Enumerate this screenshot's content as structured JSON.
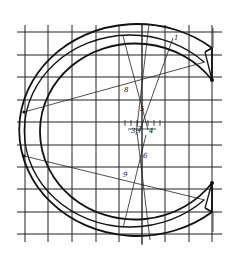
{
  "diagram": {
    "labels": [
      {
        "id": "8",
        "text": "8",
        "x": 124,
        "y": 92
      },
      {
        "id": "5",
        "text": "5",
        "x": 140,
        "y": 111
      },
      {
        "id": "3",
        "text": "3",
        "x": 131,
        "y": 133
      },
      {
        "id": "2",
        "text": "2",
        "x": 137,
        "y": 131
      },
      {
        "id": "4",
        "text": "4",
        "x": 149,
        "y": 133
      },
      {
        "id": "6",
        "text": "6",
        "x": 143,
        "y": 158
      },
      {
        "id": "9",
        "text": "9",
        "x": 123,
        "y": 177
      },
      {
        "id": "1",
        "text": "1",
        "x": 174,
        "y": 40
      }
    ],
    "grid": {
      "verticals": [
        25,
        48,
        72,
        96,
        119,
        142,
        165,
        189,
        212
      ],
      "horizontals": [
        32,
        55,
        77,
        100,
        122,
        145,
        167,
        189,
        212,
        234
      ]
    },
    "colors": {
      "ink": "#111111",
      "paper": "#ffffff"
    }
  }
}
